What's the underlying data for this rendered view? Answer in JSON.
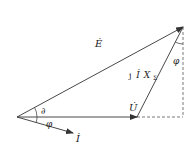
{
  "diagram": {
    "type": "phasor-diagram",
    "labels": {
      "E": "Ė",
      "U": "U̇",
      "I": "İ",
      "jIX": "j",
      "jIX_I": "İ",
      "jIX_X": "X",
      "jIX_sub": "Σ",
      "delta": "∂",
      "phi_bottom": "φ",
      "phi_top": "φ"
    },
    "colors": {
      "line": "#333333",
      "dashed": "#555555"
    }
  }
}
